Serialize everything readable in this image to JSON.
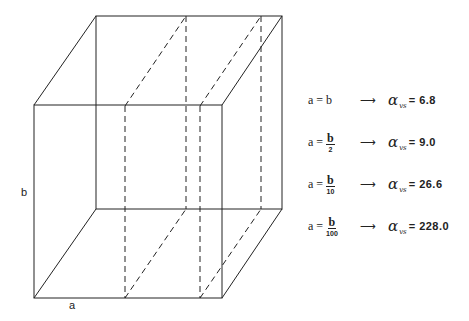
{
  "figure": {
    "labels": {
      "height": "b",
      "width": "a"
    },
    "rows": [
      {
        "lhs": "a = b",
        "frac_num": "",
        "frac_den": "",
        "arrow": "⟶",
        "symbol": "α",
        "subscript": "vs",
        "equals": "=",
        "value": "6.8"
      },
      {
        "lhs": "a =",
        "frac_num": "b",
        "frac_den": "2",
        "arrow": "⟶",
        "symbol": "α",
        "subscript": "vs",
        "equals": "=",
        "value": "9.0"
      },
      {
        "lhs": "a =",
        "frac_num": "b",
        "frac_den": "10",
        "arrow": "⟶",
        "symbol": "α",
        "subscript": "vs",
        "equals": "=",
        "value": "26.6"
      },
      {
        "lhs": "a =",
        "frac_num": "b",
        "frac_den": "100",
        "arrow": "⟶",
        "symbol": "α",
        "subscript": "vs",
        "equals": "=",
        "value": "228.0"
      }
    ]
  }
}
